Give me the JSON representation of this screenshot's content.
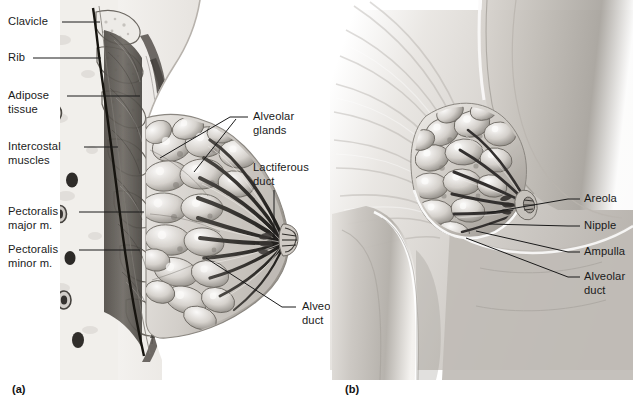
{
  "figure": {
    "width": 633,
    "height": 404,
    "background": "#ffffff",
    "type": "anatomical-illustration",
    "line_color": "#1a1a1a",
    "text_color": "#1a1a1a"
  },
  "panels": [
    {
      "id": "a",
      "letter": "(a)",
      "view": "sagittal-section",
      "description": "Sagittal (side) cut-away section through the chest wall and breast showing clavicle, ribs, intercostal muscles, pectoralis major and minor muscles, adipose tissue, alveolar glands (lobules), lactiferous ducts converging on the nipple, and alveolar ducts."
    },
    {
      "id": "b",
      "letter": "(b)",
      "view": "lateral-external",
      "description": "Lateral external view of the torso with the breast partially cut away to reveal alveolar glands, alveolar ducts, ampulla, nipple and areola."
    }
  ],
  "labels_panel_a": [
    {
      "key": "clavicle",
      "text": "Clavicle",
      "lines": [
        "Clavicle"
      ],
      "x": 8,
      "y": 15,
      "align": "left",
      "leader_from": [
        62,
        22
      ],
      "leader_to": [
        96,
        22
      ]
    },
    {
      "key": "rib",
      "text": "Rib",
      "lines": [
        "Rib"
      ],
      "x": 8,
      "y": 51,
      "align": "left",
      "leader_from": [
        33,
        58
      ],
      "leader_to": [
        97,
        58
      ]
    },
    {
      "key": "adipose-tissue",
      "text": "Adipose tissue",
      "lines": [
        "Adipose",
        "tissue"
      ],
      "x": 8,
      "y": 89,
      "align": "left",
      "leader_from": [
        67,
        96
      ],
      "leader_to": [
        137,
        96
      ]
    },
    {
      "key": "intercostal-muscles",
      "text": "Intercostal muscles",
      "lines": [
        "Intercostal",
        "muscles"
      ],
      "x": 8,
      "y": 140,
      "align": "left",
      "leader_from": [
        84,
        147
      ],
      "leader_to": [
        114,
        147
      ]
    },
    {
      "key": "pectoralis-major",
      "text": "Pectoralis major m.",
      "lines": [
        "Pectoralis",
        "major m."
      ],
      "x": 8,
      "y": 205,
      "align": "left",
      "leader_from": [
        79,
        212
      ],
      "leader_to": [
        140,
        212
      ]
    },
    {
      "key": "pectoralis-minor",
      "text": "Pectoralis minor m.",
      "lines": [
        "Pectoralis",
        "minor m."
      ],
      "x": 8,
      "y": 243,
      "align": "left",
      "leader_from": [
        79,
        250
      ],
      "leader_to": [
        136,
        250
      ]
    },
    {
      "key": "alveolar-glands",
      "text": "Alveolar glands",
      "lines": [
        "Alveolar",
        "glands"
      ],
      "x": 251,
      "y": 110,
      "align": "left",
      "leader_from": [
        247,
        117
      ],
      "leader_to": [
        160,
        158
      ],
      "leader_to_2": [
        192,
        172
      ]
    },
    {
      "key": "lactiferous-duct",
      "text": "Lactiferous duct",
      "lines": [
        "Lactiferous",
        "duct"
      ],
      "x": 251,
      "y": 161,
      "align": "left",
      "leader_from": [
        274,
        190
      ],
      "leader_to": [
        274,
        238
      ]
    },
    {
      "key": "alveolar-duct-a",
      "text": "Alveolar duct",
      "lines": [
        "Alveolar",
        "duct"
      ],
      "x": 300,
      "y": 300,
      "align": "left",
      "leader_from": [
        296,
        307
      ],
      "leader_to": [
        207,
        258
      ]
    }
  ],
  "labels_panel_b": [
    {
      "key": "areola",
      "text": "Areola",
      "lines": [
        "Areola"
      ],
      "x": 584,
      "y": 192,
      "align": "left",
      "leader_from": [
        580,
        199
      ],
      "leader_to": [
        487,
        213
      ]
    },
    {
      "key": "nipple",
      "text": "Nipple",
      "lines": [
        "Nipple"
      ],
      "x": 584,
      "y": 219,
      "align": "left",
      "leader_from": [
        580,
        226
      ],
      "leader_to": [
        489,
        224
      ]
    },
    {
      "key": "ampulla",
      "text": "Ampulla",
      "lines": [
        "Ampulla"
      ],
      "x": 584,
      "y": 245,
      "align": "left",
      "leader_from": [
        580,
        252
      ],
      "leader_to": [
        476,
        231
      ]
    },
    {
      "key": "alveolar-duct-b",
      "text": "Alveolar duct",
      "lines": [
        "Alveolar",
        "duct"
      ],
      "x": 584,
      "y": 270,
      "align": "left",
      "leader_from": [
        580,
        277
      ],
      "leader_to": [
        466,
        238
      ]
    }
  ],
  "panel_letters": [
    {
      "key": "letter-a",
      "text": "(a)",
      "x": 12,
      "y": 383
    },
    {
      "key": "letter-b",
      "text": "(b)",
      "x": 345,
      "y": 383
    }
  ],
  "palette": {
    "background": "#ffffff",
    "line": "#1a1a1a",
    "text": "#1a1a1a",
    "skin_light": "#e9e6e2",
    "skin_mid": "#c9c5c0",
    "skin_shadow": "#9d9893",
    "bone_light": "#ebe9e5",
    "bone_speckle": "#b5b0aa",
    "muscle_dark": "#5a5651",
    "muscle_mid": "#7e7a74",
    "gland_light": "#f2f0ed",
    "gland_mid": "#b9b4ae",
    "gland_dark": "#6e6a65",
    "duct_dark": "#2e2b28",
    "fat_pale": "#efece8",
    "vessel_dark": "#3a3734",
    "torso_mid": "#b2aea9",
    "torso_dark": "#8c8782"
  }
}
